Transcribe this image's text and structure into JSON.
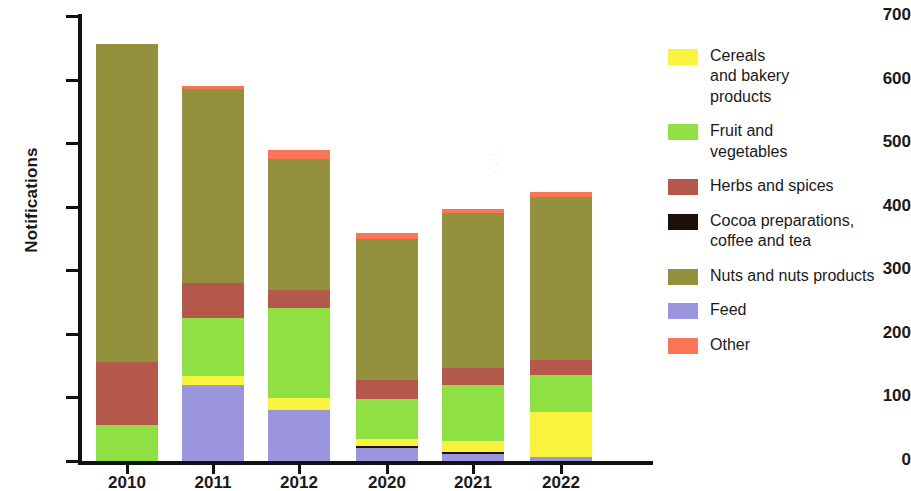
{
  "chart_data": {
    "type": "bar",
    "subtype": "stacked-bar",
    "title": "",
    "xlabel": "",
    "ylabel": "Notifications",
    "ylim": [
      0,
      700
    ],
    "y_ticks": [
      0,
      100,
      200,
      300,
      400,
      500,
      600,
      700
    ],
    "grid": false,
    "legend_position": "right",
    "categories": [
      "2010",
      "2011",
      "2012",
      "2020",
      "2021",
      "2022"
    ],
    "series": [
      {
        "name": "Cereals and bakery products",
        "color": "#FAF33E",
        "values": [
          0,
          14,
          19,
          11,
          17,
          71
        ]
      },
      {
        "name": "Fruit and vegetables",
        "color": "#8FE043",
        "values": [
          57,
          91,
          142,
          64,
          88,
          58
        ]
      },
      {
        "name": "Herbs and spices",
        "color": "#B5584C",
        "values": [
          99,
          55,
          28,
          30,
          27,
          24
        ]
      },
      {
        "name": "Cocoa preparations, coffee and tea",
        "color": "#1C1008",
        "values": [
          0,
          0,
          0,
          3,
          3,
          0
        ]
      },
      {
        "name": "Nuts and nuts products",
        "color": "#93913B",
        "values": [
          500,
          305,
          206,
          222,
          244,
          256
        ]
      },
      {
        "name": "Feed",
        "color": "#9B95DE",
        "values": [
          0,
          120,
          80,
          20,
          11,
          6
        ]
      },
      {
        "name": "Other",
        "color": "#FB7455",
        "values": [
          0,
          5,
          14,
          9,
          6,
          8
        ]
      }
    ],
    "totals": [
      656,
      590,
      489,
      349,
      396,
      423
    ],
    "stack_order": [
      "Feed",
      "Cocoa preparations, coffee and tea",
      "Cereals and bakery products",
      "Fruit and vegetables",
      "Herbs and spices",
      "Nuts and nuts products",
      "Other"
    ]
  },
  "axes": {
    "y_title": "Notifications",
    "y_tick_labels": [
      "700",
      "600",
      "500",
      "400",
      "300",
      "200",
      "100",
      "0"
    ],
    "x_tick_labels": [
      "2010",
      "2011",
      "2012",
      "2020",
      "2021",
      "2022"
    ]
  },
  "legend": {
    "items": [
      {
        "label": "Cereals\nand bakery\nproducts",
        "color": "#FAF33E"
      },
      {
        "label": "Fruit and\nvegetables",
        "color": "#8FE043"
      },
      {
        "label": "Herbs and spices",
        "color": "#B5584C"
      },
      {
        "label": "Cocoa preparations,\ncoffee and tea",
        "color": "#1C1008"
      },
      {
        "label": "Nuts and nuts products",
        "color": "#93913B"
      },
      {
        "label": "Feed",
        "color": "#9B95DE"
      },
      {
        "label": "Other",
        "color": "#FB7455"
      }
    ]
  }
}
